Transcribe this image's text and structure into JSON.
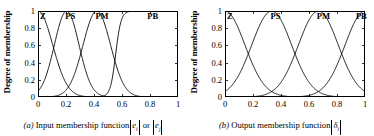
{
  "figure": {
    "panels": [
      {
        "id": "a",
        "caption_prefix": "(a)",
        "caption_text": "Input membership function",
        "caption_symbols": [
          {
            "base": "e",
            "sub": "i"
          },
          {
            "sep": "or"
          },
          {
            "base": "e",
            "sub": "j"
          }
        ],
        "ylabel": "Degree of membership",
        "yticks": [
          "1",
          "0.8",
          "0.6",
          "0.4",
          "0.2",
          "0"
        ],
        "xticks": [
          "0",
          "0.2",
          "0.4",
          "0.6",
          "0.8",
          "1"
        ],
        "mf_labels": [
          "Z",
          "PS",
          "PM",
          "PB"
        ],
        "chart_data": {
          "type": "line",
          "title": "(a) Input membership function",
          "xlabel": "|e_i| or |e_j|",
          "ylabel": "Degree of membership",
          "xlim": [
            0,
            1
          ],
          "ylim": [
            0,
            1
          ],
          "xticks": [
            0,
            0.2,
            0.4,
            0.6,
            0.8,
            1
          ],
          "yticks": [
            0,
            0.2,
            0.4,
            0.6,
            0.8,
            1
          ],
          "grid": false,
          "legend": "inside-top",
          "series": [
            {
              "name": "Z",
              "type": "gaussian-left-shoulder",
              "center": 0.0,
              "sigma": 0.105,
              "peak": 1.0,
              "label_x": 0.015
            },
            {
              "name": "PS",
              "type": "gaussian",
              "center": 0.205,
              "sigma": 0.088,
              "peak": 1.0,
              "label_x": 0.195
            },
            {
              "name": "PM",
              "type": "gaussian",
              "center": 0.42,
              "sigma": 0.098,
              "peak": 1.0,
              "label_x": 0.41
            },
            {
              "name": "PB",
              "type": "sigmoid-right-shoulder",
              "center": 0.555,
              "slope": 52,
              "peak": 1.0,
              "label_x": 0.78
            }
          ]
        }
      },
      {
        "id": "b",
        "caption_prefix": "(b)",
        "caption_text": "Output membership function",
        "caption_symbols": [
          {
            "base": "δ",
            "sub": "i"
          }
        ],
        "ylabel": "Degree of membership",
        "yticks": [
          "1",
          "0.8",
          "0.6",
          "0.4",
          "0.2",
          "0"
        ],
        "xticks": [
          "0",
          "0.2",
          "0.4",
          "0.6",
          "0.8",
          "1"
        ],
        "mf_labels": [
          "Z",
          "PS",
          "PM",
          "PB"
        ],
        "chart_data": {
          "type": "line",
          "title": "(b) Output membership function",
          "xlabel": "|δ_i|",
          "ylabel": "Degree of membership",
          "xlim": [
            0,
            1
          ],
          "ylim": [
            0,
            1
          ],
          "xticks": [
            0,
            0.2,
            0.4,
            0.6,
            0.8,
            1
          ],
          "yticks": [
            0,
            0.2,
            0.4,
            0.6,
            0.8,
            1
          ],
          "grid": false,
          "legend": "inside-top",
          "series": [
            {
              "name": "Z",
              "type": "gaussian",
              "center": 0.0,
              "sigma": 0.142,
              "peak": 1.0,
              "label_x": 0.015
            },
            {
              "name": "PS",
              "type": "gaussian",
              "center": 0.3333,
              "sigma": 0.142,
              "peak": 1.0,
              "label_x": 0.325
            },
            {
              "name": "PM",
              "type": "gaussian",
              "center": 0.6667,
              "sigma": 0.142,
              "peak": 1.0,
              "label_x": 0.655
            },
            {
              "name": "PB",
              "type": "gaussian",
              "center": 1.0,
              "sigma": 0.142,
              "peak": 1.0,
              "label_x": 0.935
            }
          ]
        }
      }
    ]
  }
}
